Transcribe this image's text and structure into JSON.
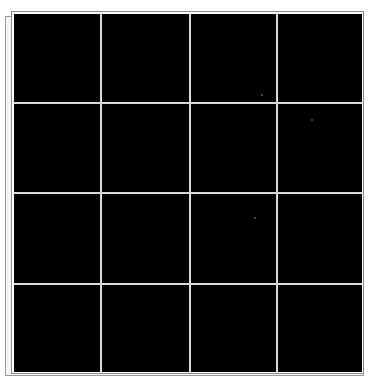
{
  "image": {
    "description": "Black square panel divided into a 4x4 grid by thin light-gray lines, with a double offset frame",
    "grid": {
      "rows": 4,
      "columns": 4,
      "vertical_lines_x": [
        100,
        189,
        276
      ],
      "horizontal_lines_y": [
        102,
        192,
        283
      ]
    },
    "colors": {
      "panel_fill": "#000000",
      "grid_line": "#d9d9d9",
      "frame_line": "#8c8c8c",
      "background": "#ffffff"
    },
    "specks": [
      {
        "x": 312,
        "y": 120
      },
      {
        "x": 255,
        "y": 218
      },
      {
        "x": 262,
        "y": 95
      }
    ]
  }
}
